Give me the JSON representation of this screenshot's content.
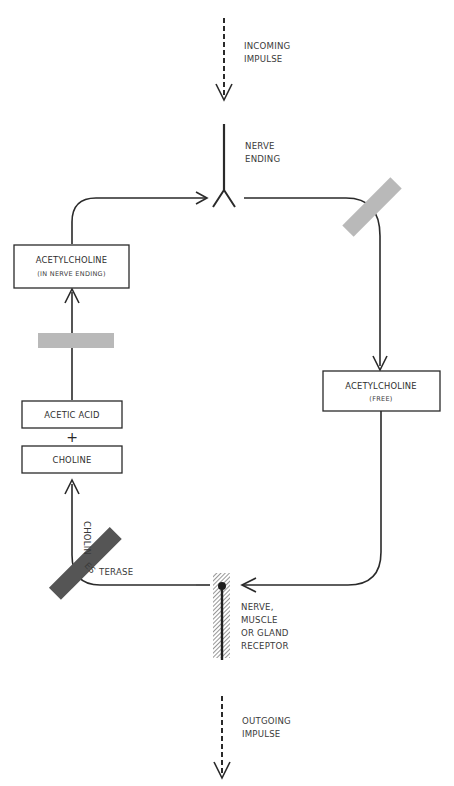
{
  "labels": {
    "incoming": [
      "INCOMING",
      "IMPULSE"
    ],
    "nerve_ending": [
      "NERVE",
      "ENDING"
    ],
    "receptor": [
      "NERVE,",
      "MUSCLE",
      "OR  GLAND",
      "RECEPTOR"
    ],
    "outgoing": [
      "OUTGOING",
      "IMPULSE"
    ],
    "enzyme": {
      "vertical_part": "CHOLIN",
      "middle_part": "ES",
      "horizontal_part": "TERASE",
      "full": "CHOLINESTERASE"
    }
  },
  "boxes": {
    "ach_nerve_ending": [
      "ACETYLCHOLINE",
      "(IN NERVE ENDING)"
    ],
    "ach_free": [
      "ACETYLCHOLINE",
      "(FREE)"
    ],
    "acetic_acid": "ACETIC  ACID",
    "plus": "+",
    "choline": "CHOLINE"
  },
  "colors": {
    "line": "#2a2a2a",
    "light_block": "#b9b9b9",
    "dark_block": "#555555",
    "hatch": "#8a8a8a"
  }
}
